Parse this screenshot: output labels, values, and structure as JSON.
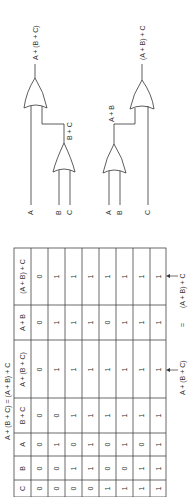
{
  "circuit_top": {
    "inputs": [
      "A",
      "B",
      "C"
    ],
    "intermediate_label": "B + C",
    "output_label": "A + (B + C)"
  },
  "circuit_bottom": {
    "inputs": [
      "A",
      "B",
      "C"
    ],
    "intermediate_label": "A + B",
    "output_label": "(A + B) + C"
  },
  "table": {
    "title": "A + (B + C) = (A + B) + C",
    "headers": [
      "C",
      "B",
      "A",
      "B + C",
      "A + (B + C)",
      "A + B",
      "(A + B) + C"
    ],
    "rows": [
      [
        "0",
        "0",
        "0",
        "0",
        "0",
        "0",
        "0"
      ],
      [
        "0",
        "0",
        "1",
        "0",
        "1",
        "1",
        "1"
      ],
      [
        "0",
        "1",
        "0",
        "1",
        "1",
        "1",
        "1"
      ],
      [
        "0",
        "1",
        "1",
        "1",
        "1",
        "1",
        "1"
      ],
      [
        "1",
        "0",
        "0",
        "1",
        "1",
        "0",
        "1"
      ],
      [
        "1",
        "0",
        "1",
        "1",
        "1",
        "1",
        "1"
      ],
      [
        "1",
        "1",
        "0",
        "1",
        "1",
        "1",
        "1"
      ],
      [
        "1",
        "1",
        "1",
        "1",
        "1",
        "1",
        "1"
      ]
    ]
  },
  "annotation": {
    "left": "A + (B + C)",
    "equals": "=",
    "right": "(A + B) + C"
  }
}
